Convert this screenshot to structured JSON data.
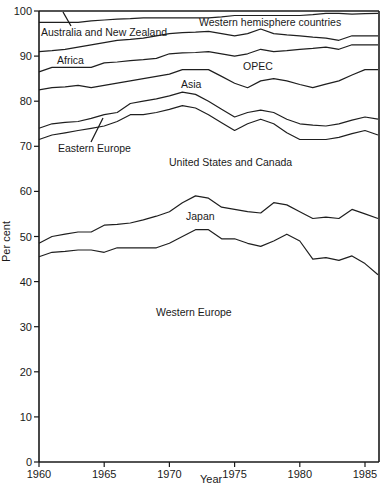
{
  "chart_data": {
    "type": "area",
    "stacked": true,
    "title": "",
    "xlabel": "Year",
    "ylabel": "Per cent",
    "xlim": [
      1960,
      1986
    ],
    "ylim": [
      0,
      100
    ],
    "grid": false,
    "x_ticks": [
      1960,
      1965,
      1970,
      1975,
      1980,
      1985
    ],
    "y_ticks": [
      0,
      10,
      20,
      30,
      40,
      50,
      60,
      70,
      80,
      90,
      100
    ],
    "x": [
      1960,
      1961,
      1962,
      1963,
      1964,
      1965,
      1966,
      1967,
      1968,
      1969,
      1970,
      1971,
      1972,
      1973,
      1974,
      1975,
      1976,
      1977,
      1978,
      1979,
      1980,
      1981,
      1982,
      1983,
      1984,
      1985,
      1986
    ],
    "cumulative_boundaries": [
      {
        "name": "Western Europe (top)",
        "values": [
          45.5,
          46.5,
          46.7,
          47,
          47,
          46.5,
          47.5,
          47.5,
          47.5,
          47.5,
          48.5,
          50,
          51.5,
          51.5,
          49.5,
          49.5,
          48.5,
          47.8,
          49,
          50.5,
          49,
          45,
          45.3,
          44.7,
          45.7,
          44,
          41.5
        ]
      },
      {
        "name": "Japan (top)",
        "values": [
          48.5,
          50,
          50.5,
          51,
          51,
          52.5,
          52.7,
          53,
          53.7,
          54.5,
          55.5,
          57.5,
          59,
          58.5,
          56.5,
          56,
          55.5,
          55.2,
          57.5,
          57,
          55.5,
          54,
          54.3,
          54,
          56,
          55,
          54
        ]
      },
      {
        "name": "United States and Canada (top)",
        "values": [
          71.5,
          72.5,
          73,
          73.5,
          74,
          74.5,
          75.5,
          77,
          77,
          77.5,
          78.2,
          79,
          78.5,
          77,
          75.2,
          73.5,
          75,
          76,
          75,
          73,
          71.5,
          71.5,
          71.5,
          72,
          72.8,
          73.5,
          72.5
        ]
      },
      {
        "name": "Eastern Europe (top)",
        "values": [
          74,
          75,
          75.3,
          75.5,
          76.2,
          77,
          77.5,
          79.5,
          80,
          80.5,
          81.2,
          82,
          81.5,
          80,
          78.2,
          76.5,
          77.5,
          78,
          77.5,
          76,
          75,
          74.7,
          74.5,
          75,
          75.8,
          76.5,
          76
        ]
      },
      {
        "name": "Asia (top)",
        "values": [
          82.5,
          83,
          83.2,
          83.5,
          83,
          83.5,
          84,
          84.5,
          85,
          85.5,
          86,
          87,
          87,
          87,
          85.5,
          84,
          83,
          84.5,
          85,
          84.5,
          83.7,
          83,
          83.8,
          84.5,
          85.8,
          87,
          87
        ]
      },
      {
        "name": "OPEC (top)",
        "values": [
          86.5,
          87.5,
          87.5,
          87.5,
          87.5,
          88.5,
          88.7,
          89,
          89.2,
          89.5,
          90.5,
          90.7,
          90.8,
          91,
          90.5,
          90,
          90.5,
          91.5,
          91,
          91.2,
          91.5,
          91.7,
          92,
          91.5,
          92.5,
          92.5,
          92.5
        ]
      },
      {
        "name": "Africa (top)",
        "values": [
          91,
          91.2,
          91.5,
          92,
          92.5,
          93,
          93.5,
          93.7,
          94,
          94.5,
          95,
          95.2,
          95.3,
          95.5,
          95,
          94.5,
          95,
          96,
          95,
          94.7,
          94.5,
          94.2,
          94,
          93.5,
          94.5,
          94.5,
          94.5
        ]
      },
      {
        "name": "Western hemisphere countries (top)",
        "values": [
          97.5,
          97.5,
          97.5,
          97.5,
          97.8,
          98,
          98.2,
          98.3,
          98.5,
          98.5,
          98.5,
          98.5,
          98.5,
          98.5,
          98.7,
          99,
          99,
          99,
          99,
          99,
          99,
          99.2,
          99.5,
          99.5,
          99.3,
          99.4,
          99.5
        ]
      },
      {
        "name": "Australia and New Zealand (top)",
        "values": [
          100,
          100,
          100,
          100,
          100,
          100,
          100,
          100,
          100,
          100,
          100,
          100,
          100,
          100,
          100,
          100,
          100,
          100,
          100,
          100,
          100,
          100,
          100,
          100,
          100,
          100,
          100
        ]
      }
    ],
    "series": [
      {
        "name": "Western Europe",
        "label_position": [
          1972,
          33
        ]
      },
      {
        "name": "Japan",
        "label_position": [
          1973,
          56
        ]
      },
      {
        "name": "United States and Canada",
        "label_position": [
          1975,
          69
        ]
      },
      {
        "name": "Eastern Europe",
        "label_position": [
          1963.5,
          71
        ]
      },
      {
        "name": "Asia",
        "label_position": [
          1971.5,
          83
        ]
      },
      {
        "name": "OPEC",
        "label_position": [
          1978,
          89
        ]
      },
      {
        "name": "Africa",
        "label_position": [
          1962,
          93
        ]
      },
      {
        "name": "Western hemisphere countries",
        "label_position": [
          1980,
          97
        ]
      },
      {
        "name": "Australia and New Zealand",
        "label_position": [
          1963,
          96
        ]
      }
    ],
    "legend": "none (inline band labels)"
  },
  "axes": {
    "xlabel": "Year",
    "ylabel": "Per cent",
    "x_tick_labels": [
      "1960",
      "1965",
      "1970",
      "1975",
      "1980",
      "1985"
    ],
    "y_tick_labels": [
      "0",
      "10",
      "20",
      "30",
      "40",
      "50",
      "60",
      "70",
      "80",
      "90",
      "100"
    ]
  },
  "labels": {
    "western_europe": "Western Europe",
    "japan": "Japan",
    "us_canada": "United States and Canada",
    "eastern_europe": "Eastern Europe",
    "asia": "Asia",
    "opec": "OPEC",
    "africa": "Africa",
    "western_hemisphere": "Western hemisphere countries",
    "australia_nz": "Australia and New Zealand"
  },
  "colors": {
    "line": "#1f1f1f",
    "background": "#ffffff"
  }
}
